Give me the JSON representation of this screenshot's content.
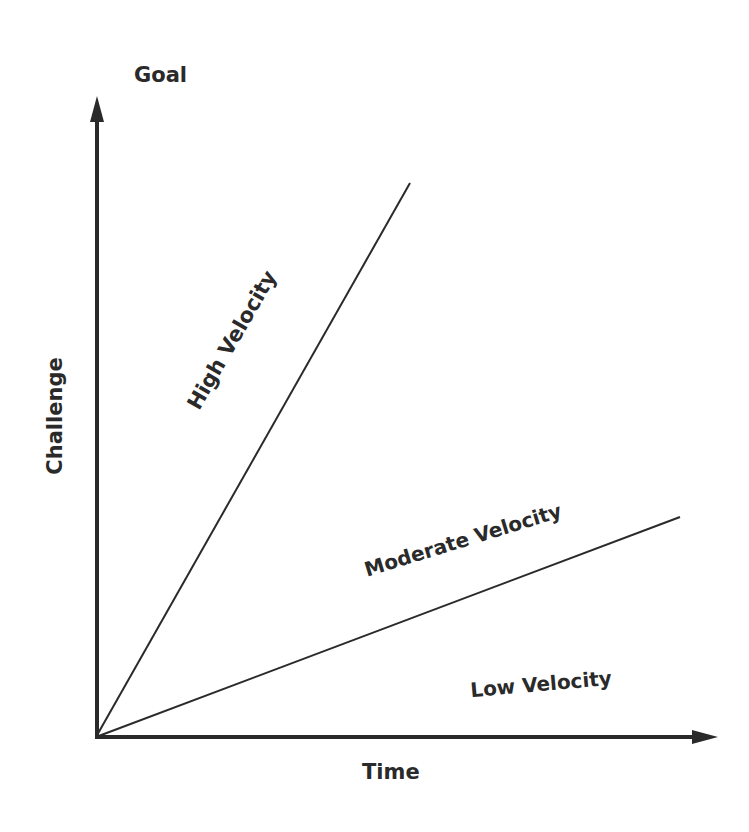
{
  "diagram": {
    "y_axis_label": "Challenge",
    "y_axis_top_label": "Goal",
    "x_axis_label": "Time",
    "regions": [
      {
        "label": "High Velocity"
      },
      {
        "label": "Moderate Velocity"
      },
      {
        "label": "Low Velocity"
      }
    ],
    "lines": [
      {
        "name": "high-velocity-boundary",
        "from": [
          96,
          737
        ],
        "to": [
          410,
          183
        ]
      },
      {
        "name": "moderate-velocity-boundary",
        "from": [
          96,
          737
        ],
        "to": [
          680,
          517
        ]
      }
    ],
    "colors": {
      "ink": "#2a2a2a",
      "background": "#ffffff"
    }
  }
}
